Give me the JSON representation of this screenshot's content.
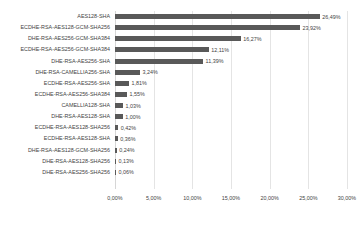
{
  "chart_data": {
    "type": "bar",
    "orientation": "horizontal",
    "title": "",
    "subtitle": "",
    "xlabel": "",
    "ylabel": "",
    "xlim": [
      0,
      30
    ],
    "ylim": null,
    "grid": true,
    "legend": false,
    "legend_position": "none",
    "value_label_suffix": "%",
    "decimal_separator": ",",
    "bar_color": "#595959",
    "gridline_color": "#e4e4e4",
    "text_color": "#3f3f3f",
    "categories": [
      "AES128-SHA",
      "ECDHE-RSA-AES128-GCM-SHA256",
      "DHE-RSA-AES256-GCM-SHA384",
      "ECDHE-RSA-AES256-GCM-SHA384",
      "DHE-RSA-AES256-SHA",
      "DHE-RSA-CAMELLIA256-SHA",
      "ECDHE-RSA-AES256-SHA",
      "ECDHE-RSA-AES256-SHA384",
      "CAMELLIA128-SHA",
      "DHE-RSA-AES128-SHA",
      "ECDHE-RSA-AES128-SHA256",
      "ECDHE-RSA-AES128-SHA",
      "DHE-RSA-AES128-GCM-SHA256",
      "DHE-RSA-AES128-SHA256",
      "DHE-RSA-AES256-SHA256"
    ],
    "values": [
      26.49,
      23.92,
      16.27,
      12.11,
      11.39,
      3.24,
      1.81,
      1.55,
      1.03,
      1.0,
      0.42,
      0.36,
      0.24,
      0.13,
      0.06
    ],
    "value_labels": [
      "26,49%",
      "23,92%",
      "16,27%",
      "12,11%",
      "11,39%",
      "3,24%",
      "1,81%",
      "1,55%",
      "1,03%",
      "1,00%",
      "0,42%",
      "0,36%",
      "0,24%",
      "0,13%",
      "0,06%"
    ],
    "xticks": [
      0,
      5,
      10,
      15,
      20,
      25,
      30
    ],
    "xtick_labels": [
      "0,00%",
      "5,00%",
      "10,00%",
      "15,00%",
      "20,00%",
      "25,00%",
      "30,00%"
    ]
  }
}
